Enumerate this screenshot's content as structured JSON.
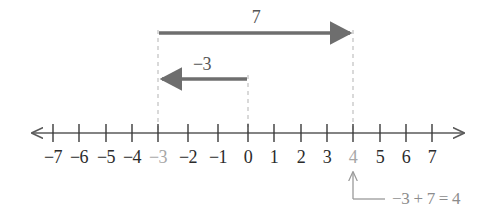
{
  "figure": {
    "kind": "number-line-addition-diagram",
    "axis": {
      "label": "number line",
      "min": -8,
      "max": 8,
      "tick_min": -7,
      "tick_max": 7,
      "tick_step": 1,
      "left_arrow": "arrow-left",
      "right_arrow": "arrow-right",
      "color": "#5a5a5a"
    },
    "tick_labels": [
      {
        "value": -7,
        "text": "−7",
        "muted": false
      },
      {
        "value": -6,
        "text": "−6",
        "muted": false
      },
      {
        "value": -5,
        "text": "−5",
        "muted": false
      },
      {
        "value": -4,
        "text": "−4",
        "muted": false
      },
      {
        "value": -3,
        "text": "−3",
        "muted": true
      },
      {
        "value": -2,
        "text": "−2",
        "muted": false
      },
      {
        "value": -1,
        "text": "−1",
        "muted": false
      },
      {
        "value": 0,
        "text": "0",
        "muted": false
      },
      {
        "value": 1,
        "text": "1",
        "muted": false
      },
      {
        "value": 2,
        "text": "2",
        "muted": false
      },
      {
        "value": 3,
        "text": "3",
        "muted": false
      },
      {
        "value": 4,
        "text": "4",
        "muted": true
      },
      {
        "value": 5,
        "text": "5",
        "muted": false
      },
      {
        "value": 6,
        "text": "6",
        "muted": false
      },
      {
        "value": 7,
        "text": "7",
        "muted": false
      }
    ],
    "jumps": [
      {
        "name": "second-jump",
        "label": "7",
        "magnitude": 7,
        "from": -3,
        "to": 4,
        "direction": "right",
        "arrowhead": "arrow-right",
        "row": "upper",
        "color": "#6e6e6e"
      },
      {
        "name": "first-jump",
        "label": "−3",
        "magnitude": 3,
        "from": 0,
        "to": -3,
        "direction": "left",
        "arrowhead": "arrow-left",
        "row": "lower",
        "color": "#6e6e6e"
      }
    ],
    "guide_lines": [
      {
        "name": "guide-at-minus-3",
        "value": -3,
        "style": "dashed",
        "color": "#b3b3b3"
      },
      {
        "name": "guide-at-zero",
        "value": 0,
        "style": "dashed",
        "color": "#b3b3b3"
      },
      {
        "name": "guide-at-four",
        "value": 4,
        "style": "dashed",
        "color": "#b3b3b3"
      }
    ],
    "callout": {
      "name": "result-callout",
      "equation": "−3 + 7 = 4",
      "points_to_value": 4,
      "arrow": "arrow-up-elbow",
      "color": "#9a9a9a"
    },
    "colors": {
      "axis": "#5a5a5a",
      "tick": "#3a3a3a",
      "tick_label": "#2b2b2b",
      "tick_label_muted": "#a7a7a7",
      "jump_arrow": "#6e6e6e",
      "jump_label": "#555555",
      "guide": "#b3b3b3",
      "callout": "#9a9a9a",
      "background": "#ffffff"
    }
  }
}
